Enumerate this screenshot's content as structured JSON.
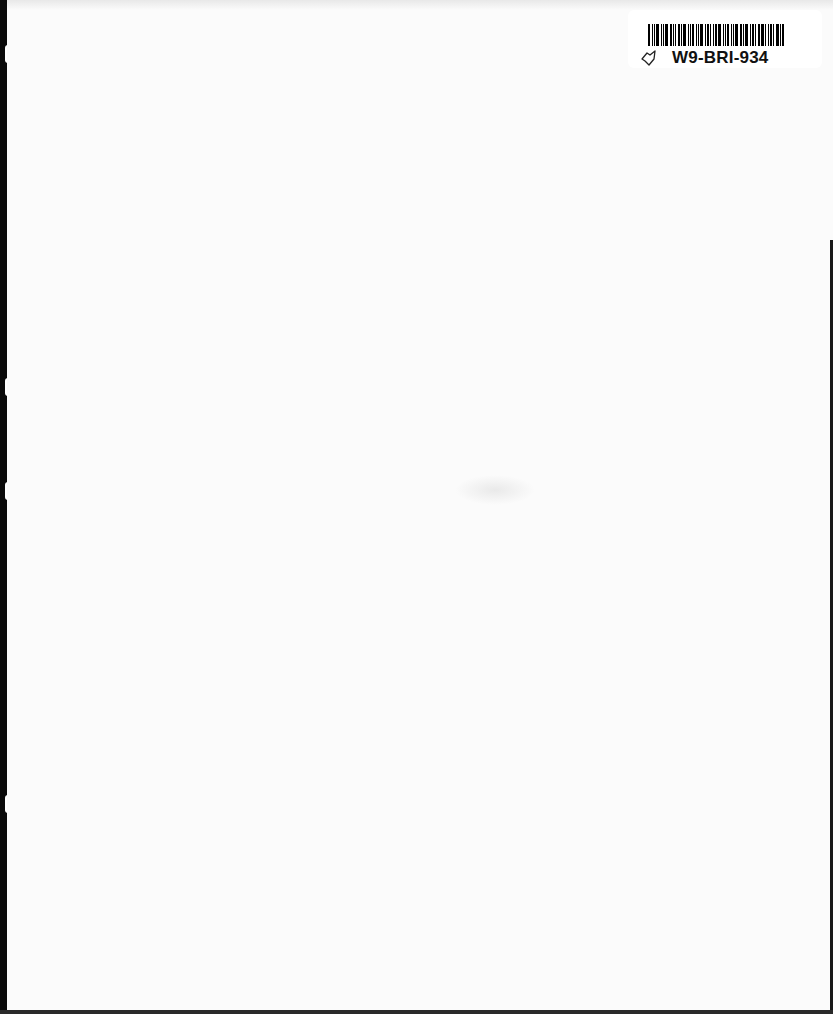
{
  "page": {
    "type": "scanned-blank-page",
    "background_color": "#fbfbfb",
    "edge_color": "#0a0a0a"
  },
  "label": {
    "code": "W9-BRI-934",
    "icon": "book-outline-icon",
    "barcode_bars": [
      2,
      1,
      1,
      3,
      1,
      1,
      3,
      2,
      1,
      1,
      2,
      1,
      3,
      1,
      1,
      2,
      1,
      1,
      3,
      1,
      2,
      1,
      1,
      2,
      3,
      1,
      1,
      2,
      1,
      1,
      3,
      2,
      1,
      3,
      1,
      2,
      1,
      2,
      3,
      1,
      1,
      2,
      1,
      3,
      1,
      2
    ]
  }
}
